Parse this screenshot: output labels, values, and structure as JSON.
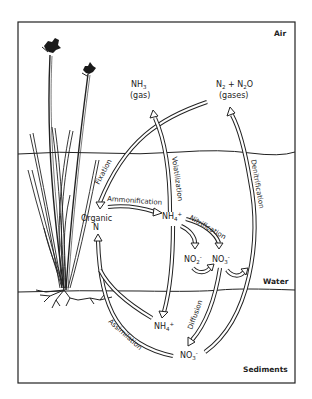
{
  "diagram": {
    "zones": {
      "air": "Air",
      "water": "Water",
      "sediments": "Sediments"
    },
    "nodes": {
      "nh3": {
        "formula": "NH",
        "sub": "3",
        "note": "(gas)"
      },
      "n2_n2o": {
        "part1": "N",
        "sub1": "2",
        "plus": " + N",
        "sub2": "2",
        "part2": "O",
        "note": "(gases)"
      },
      "organic_n": {
        "line1": "Organic",
        "line2": "N"
      },
      "nh4_water": {
        "formula": "NH",
        "sub": "4",
        "sup": "+"
      },
      "no2_water": {
        "formula": "NO",
        "sub": "2",
        "sup": "-"
      },
      "no3_water": {
        "formula": "NO",
        "sub": "3",
        "sup": "-"
      },
      "nh4_sediment": {
        "formula": "NH",
        "sub": "4",
        "sup": "+"
      },
      "no3_sediment": {
        "formula": "NO",
        "sub": "3",
        "sup": "-"
      }
    },
    "processes": {
      "fixation": "Fixation",
      "ammonification": "Ammonification",
      "volatilization": "Volatilization",
      "nitrification": "Nitrification",
      "denitrification": "Denitrification",
      "diffusion": "Diffusion",
      "assimilation": "Assimilation"
    },
    "colors": {
      "line": "#222222",
      "background": "#ffffff"
    }
  }
}
